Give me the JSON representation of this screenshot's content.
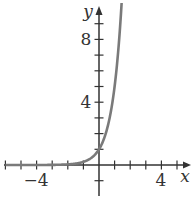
{
  "chart_data": {
    "type": "line",
    "title": "",
    "function": "y = 5^x",
    "xlabel": "x",
    "ylabel": "y",
    "xlim": [
      -6,
      5.7
    ],
    "ylim": [
      -2,
      10.3
    ],
    "x_ticks": [
      -6,
      -5,
      -4,
      -3,
      -2,
      -1,
      1,
      2,
      3,
      4,
      5
    ],
    "y_ticks": [
      -1,
      1,
      2,
      3,
      4,
      5,
      6,
      7,
      8,
      9
    ],
    "x_tick_labels": [
      {
        "value": -4,
        "label": "−4"
      },
      {
        "value": 4,
        "label": "4"
      }
    ],
    "y_tick_labels": [
      {
        "value": 4,
        "label": "4"
      },
      {
        "value": 8,
        "label": "8"
      }
    ],
    "series": [
      {
        "name": "exponential curve",
        "color": "#7a7a7a",
        "x": [
          -6,
          -4,
          -3,
          -2,
          -1.5,
          -1,
          -0.5,
          0,
          0.25,
          0.5,
          0.75,
          1,
          1.25,
          1.47
        ],
        "y": [
          0.0001,
          0.0016,
          0.008,
          0.04,
          0.089,
          0.2,
          0.447,
          1,
          1.495,
          2.236,
          3.344,
          5,
          7.477,
          10.65
        ]
      }
    ],
    "grid": false,
    "legend": "none"
  },
  "labels": {
    "x_axis": "x",
    "y_axis": "y",
    "x_neg4": "−4",
    "x_pos4": "4",
    "y_4": "4",
    "y_8": "8"
  }
}
